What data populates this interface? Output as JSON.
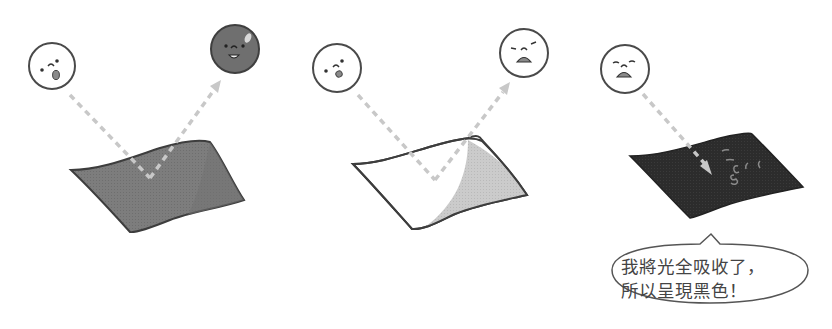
{
  "figure": {
    "type": "illustration",
    "topic": "light reflection and absorption by colored surfaces",
    "colors": {
      "background": "#ffffff",
      "outline": "#4a4a4a",
      "arrow": "#c8c8c8",
      "gray_sheet": "#7a7a7a",
      "gray_ball": "#6f6f6f",
      "white_sheet": "#ffffff",
      "white_sheet_shade": "#c9c9c9",
      "black_sheet": "#2a2a2a",
      "mouth": "#8a8a8a"
    },
    "panels": [
      {
        "id": "gray-surface",
        "incoming_face": "surprised",
        "surface": "gray sheet",
        "reflected_face": "happy gray ball",
        "arrows": [
          "incident",
          "reflected"
        ]
      },
      {
        "id": "white-surface",
        "incoming_face": "surprised",
        "surface": "white sheet with curled shaded corner",
        "reflected_face": "distressed",
        "arrows": [
          "incident",
          "reflected"
        ]
      },
      {
        "id": "black-surface",
        "incoming_face": "distressed",
        "surface": "black sheet",
        "reflected_face": null,
        "arrows": [
          "incident (absorbed)"
        ],
        "absorption_marks": "squiggles"
      }
    ],
    "speech_bubble": {
      "line1": "我將光全吸收了，",
      "line2": "所以呈現黑色！"
    }
  }
}
